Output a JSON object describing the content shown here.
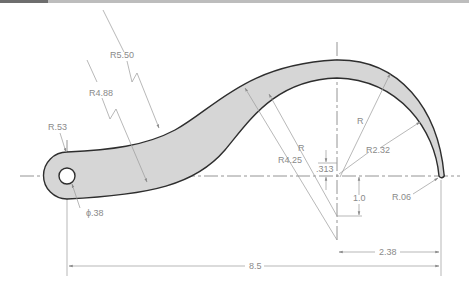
{
  "figure": {
    "type": "mechanical-drawing"
  },
  "colors": {
    "part_fill": "#d6d6d6",
    "part_outline": "#2e2e2e",
    "dimension_line": "#9a9a9a",
    "label_text": "#8a8a8a",
    "header_bar": "#6e6e6e"
  },
  "dimensions": {
    "r550": "R5.50",
    "r488": "R4.88",
    "r053": "R.53",
    "dia038": "ϕ.38",
    "r_upper": "R",
    "r_inner": "R",
    "r425": "R4.25",
    "r232": "R2.32",
    "off0313": ".313",
    "off10": "1.0",
    "r006": "R.06",
    "len238": "2.38",
    "len85": "8.5"
  }
}
